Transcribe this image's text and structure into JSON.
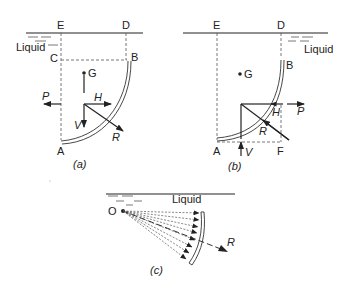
{
  "figure": {
    "panels": [
      {
        "id": "a",
        "caption": "(a)",
        "fluid_label": "Liquid",
        "points": {
          "E": "E",
          "D": "D",
          "C": "C",
          "B": "B",
          "A": "A",
          "G": "G"
        },
        "forces": {
          "P": "P",
          "H": "H",
          "V": "V",
          "R": "R"
        },
        "liquid_side": "above/left of surface (concave side)"
      },
      {
        "id": "b",
        "caption": "(b)",
        "fluid_label": "Liquid",
        "points": {
          "E": "E",
          "D": "D",
          "B": "B",
          "A": "A",
          "F": "F",
          "G": "G"
        },
        "forces": {
          "P": "P",
          "H": "H",
          "V": "V",
          "R": "R"
        },
        "liquid_side": "right/convex side of surface"
      },
      {
        "id": "c",
        "caption": "(c)",
        "fluid_label": "Liquid",
        "points": {
          "O": "O"
        },
        "forces": {
          "R": "R"
        },
        "pressure_rays": 8
      }
    ]
  }
}
